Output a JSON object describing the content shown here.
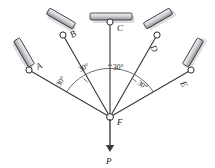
{
  "diagram": {
    "colors": {
      "member": "#3a3a42",
      "support_fill": "#d8d8dc",
      "support_stroke": "#2b2b30",
      "pin_fill": "#ffffff",
      "pin_stroke": "#2b2b30",
      "shadow": "#b6b6bb",
      "text": "#1a1a1a",
      "background": "#ffffff"
    },
    "joint": {
      "name": "F",
      "label": "F",
      "x": 110,
      "y": 117
    },
    "load": {
      "label": "P",
      "direction": "down",
      "tip_y": 150,
      "label_y": 163
    },
    "supports": [
      {
        "label": "A",
        "x": 28,
        "y": 68,
        "member_angle_deg": 150,
        "bar_angle_deg": 60
      },
      {
        "label": "B",
        "x": 62,
        "y": 33,
        "member_angle_deg": 120,
        "bar_angle_deg": 30
      },
      {
        "label": "C",
        "x": 110,
        "y": 20,
        "member_angle_deg": 90,
        "bar_angle_deg": 0
      },
      {
        "label": "D",
        "x": 158,
        "y": 33,
        "member_angle_deg": 60,
        "bar_angle_deg": 330
      },
      {
        "label": "E",
        "x": 192,
        "y": 68,
        "member_angle_deg": 30,
        "bar_angle_deg": 300
      }
    ],
    "angles": [
      {
        "value": "30°",
        "x": 60,
        "y": 84,
        "rotate": -58
      },
      {
        "value": "30°",
        "x": 83,
        "y": 70,
        "rotate": -28
      },
      {
        "value": "30°",
        "x": 114,
        "y": 68,
        "rotate": 0
      },
      {
        "value": "30°",
        "x": 140,
        "y": 83,
        "rotate": 28
      }
    ],
    "labels": {
      "A": {
        "x": 38,
        "y": 70,
        "rotate": -30
      },
      "B": {
        "x": 72,
        "y": 38,
        "rotate": -30
      },
      "C": {
        "x": 117,
        "y": 30,
        "rotate": 0
      },
      "D": {
        "x": 152,
        "y": 46,
        "rotate": 62
      },
      "E": {
        "x": 182,
        "y": 82,
        "rotate": 62
      },
      "F": {
        "x": 118,
        "y": 124,
        "rotate": 0
      },
      "P": {
        "x": 110,
        "y": 163,
        "rotate": 0
      }
    }
  }
}
